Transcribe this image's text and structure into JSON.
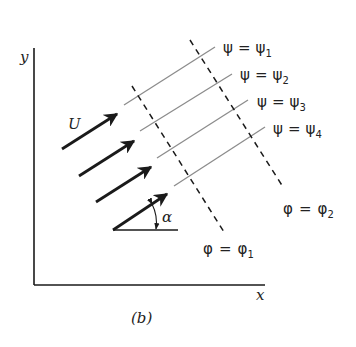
{
  "figure": {
    "caption": "(b)",
    "axes": {
      "x_label": "x",
      "y_label": "y"
    },
    "velocity_label": "U",
    "angle_label": "α",
    "streamlines": [
      {
        "lhs": "ψ",
        "eq": "=",
        "rhs": "ψ",
        "sub": "1"
      },
      {
        "lhs": "ψ",
        "eq": "=",
        "rhs": "ψ",
        "sub": "2"
      },
      {
        "lhs": "ψ",
        "eq": "=",
        "rhs": "ψ",
        "sub": "3"
      },
      {
        "lhs": "ψ",
        "eq": "=",
        "rhs": "ψ",
        "sub": "4"
      }
    ],
    "potential_lines": [
      {
        "lhs": "φ",
        "eq": "=",
        "rhs": "φ",
        "sub": "1"
      },
      {
        "lhs": "φ",
        "eq": "=",
        "rhs": "φ",
        "sub": "2"
      }
    ],
    "colors": {
      "ink": "#1a1a1a",
      "streamline": "#8c8c8c"
    }
  }
}
